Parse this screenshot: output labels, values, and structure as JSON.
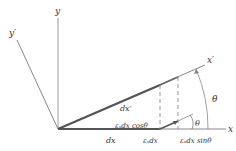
{
  "diagram": {
    "axes": {
      "x": "x",
      "y": "y",
      "x_prime": "x′",
      "y_prime": "y′"
    },
    "labels": {
      "theta_large": "θ",
      "theta_small": "θ",
      "dx": "dx",
      "dx_prime": "dx′",
      "eps_dx_cos": "εₓdx cosθ",
      "eps_dx": "εₓdx",
      "eps_dx_sin": "εₓdx sinθ"
    },
    "colors": {
      "axis": "#888888",
      "element": "#555555",
      "dashed": "#999999",
      "text": "#333333"
    }
  }
}
